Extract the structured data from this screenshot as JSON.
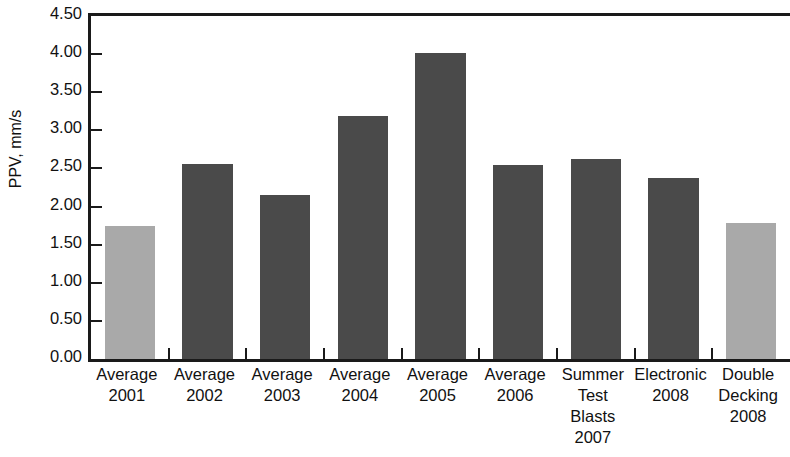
{
  "chart_data": {
    "type": "bar",
    "title": "",
    "subtitle": "",
    "xlabel": "",
    "ylabel": "PPV, mm/s",
    "ylim": [
      0.0,
      4.5
    ],
    "ytick_labels": [
      "4.50",
      "4.00",
      "3.50",
      "3.00",
      "2.50",
      "2.00",
      "1.50",
      "1.00",
      "0.50",
      "0.00"
    ],
    "ytick_values": [
      4.5,
      4.0,
      3.5,
      3.0,
      2.5,
      2.0,
      1.5,
      1.0,
      0.5,
      0.0
    ],
    "grid": false,
    "legend": "none",
    "categories": [
      "Average 2001",
      "Average 2002",
      "Average 2003",
      "Average 2004",
      "Average 2005",
      "Average 2006",
      "Summer Test Blasts 2007",
      "Electronic 2008",
      "Double Decking 2008"
    ],
    "category_lines": [
      [
        "Average",
        "2001"
      ],
      [
        "Average",
        "2002"
      ],
      [
        "Average",
        "2003"
      ],
      [
        "Average",
        "2004"
      ],
      [
        "Average",
        "2005"
      ],
      [
        "Average",
        "2006"
      ],
      [
        "Summer",
        "Test",
        "Blasts",
        "2007"
      ],
      [
        "Electronic",
        "2008"
      ],
      [
        "Double",
        "Decking",
        "2008"
      ]
    ],
    "values": [
      1.74,
      2.56,
      2.15,
      3.19,
      4.02,
      2.55,
      2.63,
      2.38,
      1.79
    ],
    "bar_colors": [
      "#a9a9a9",
      "#4a4a4a",
      "#4a4a4a",
      "#4a4a4a",
      "#4a4a4a",
      "#4a4a4a",
      "#4a4a4a",
      "#4a4a4a",
      "#a9a9a9"
    ],
    "colors": {
      "dark_bar": "#4a4a4a",
      "light_bar": "#a9a9a9",
      "axis": "#1a1a1a",
      "text": "#111111",
      "background": "#ffffff"
    }
  }
}
